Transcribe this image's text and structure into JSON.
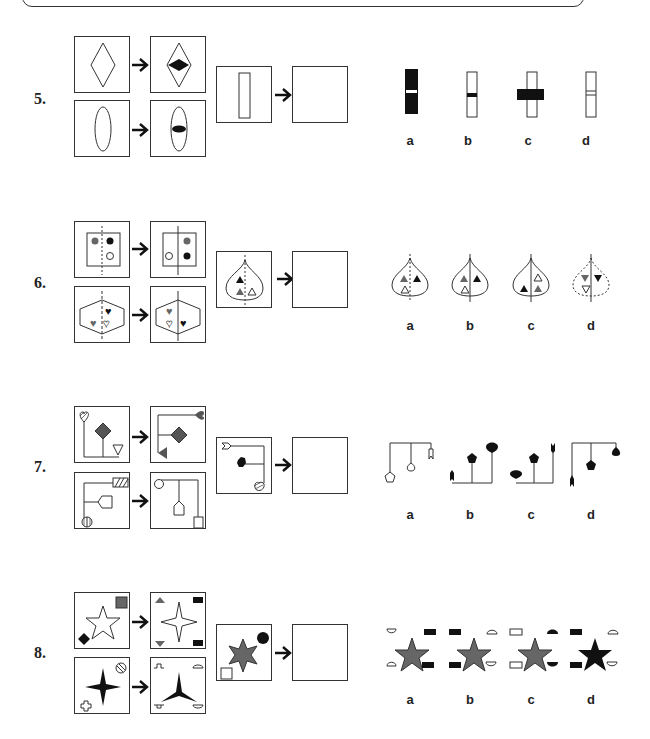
{
  "questions": [
    {
      "number": "5.",
      "description": "Shape gets a black horizontal band across its center; apply to rectangle",
      "example_pairs": [
        {
          "input": "outlined diamond",
          "output": "outlined diamond with black horizontal diamond band in center"
        },
        {
          "input": "outlined ellipse",
          "output": "outlined ellipse with black horizontal oval band in center"
        }
      ],
      "given": "outlined tall rectangle",
      "options": [
        {
          "label": "a",
          "description": "solid black rectangle with white horizontal band"
        },
        {
          "label": "b",
          "description": "outlined rectangle with black horizontal band inside"
        },
        {
          "label": "c",
          "description": "outlined rectangle with wide black bar extending outside"
        },
        {
          "label": "d",
          "description": "outlined rectangle with two thin horizontal lines"
        }
      ]
    },
    {
      "number": "6.",
      "description": "Mirror left/right halves; dotted axis becomes solid line",
      "example_pairs": [
        {
          "input": "square with gray dot left, black dot right, white dot lower right; dotted axis",
          "output": "gray dot upper right, white dot lower left, black dot lower right; solid axis"
        },
        {
          "input": "hexagon with black heart right, gray heart left, white heart right; dashed axis",
          "output": "gray heart upper left, white heart lower left, black heart lower right; solid axis"
        }
      ],
      "given": "teardrop with black triangle and gray triangle left, white triangle right; dotted axis",
      "options": [
        {
          "label": "a",
          "description": "teardrop, gray & black triangles top, white triangle lower left; dotted axis"
        },
        {
          "label": "b",
          "description": "teardrop, gray & black triangles top, white triangle lower left; solid axis"
        },
        {
          "label": "c",
          "description": "teardrop, white triangle upper right, black lower left, gray lower right; solid axis"
        },
        {
          "label": "d",
          "description": "dotted teardrop, inverted triangles; solid axis"
        }
      ]
    },
    {
      "number": "7.",
      "description": "Connector tree structure with shapes transformed",
      "example_pairs": [
        {
          "input": "hatched heart, gray diamond, white triangle on stems",
          "output": "gray heart, gray diamond, gray triangle on stems"
        },
        {
          "input": "hatched rectangle, white pentagon-tag, circle with cross",
          "output": "white circle, white house shape, white rectangle"
        }
      ],
      "given": "white arrow-tail, black hexagon, hatched teardrop",
      "options": [
        {
          "label": "a",
          "description": "white pentagon, white teardrop, white arrow-tail hanging from top bar"
        },
        {
          "label": "b",
          "description": "black arrow-tail, black pentagon, black teardrop on stems from bottom bar"
        },
        {
          "label": "c",
          "description": "black teardrop, black pentagon, black arrow-tail on stems from bottom bar"
        },
        {
          "label": "d",
          "description": "black arrow-tail, black pentagon, black teardrop hanging from top bar"
        }
      ]
    },
    {
      "number": "8.",
      "description": "Star loses one point; corner shapes split into halves at four corners",
      "example_pairs": [
        {
          "input": "white 5-point star, gray square, black diamond",
          "output": "white 4-point star, gray triangles left, black bars right"
        },
        {
          "input": "black 4-point star, hatched circle, white cross",
          "output": "black 3-point star, cross halves left, semicircles right"
        }
      ],
      "given": "gray 6-point star, black circle, white square",
      "options": [
        {
          "label": "a",
          "description": "gray 5-point star, semicircles left, black bars right"
        },
        {
          "label": "b",
          "description": "gray 5-point star, black bars left, white semicircles right"
        },
        {
          "label": "c",
          "description": "gray 5-point star, white bars left, black semicircles right"
        },
        {
          "label": "d",
          "description": "black 5-point star, black bars left, white semicircles right"
        }
      ]
    }
  ],
  "colors": {
    "black": "#111111",
    "gray": "#666666",
    "line": "#333333"
  }
}
